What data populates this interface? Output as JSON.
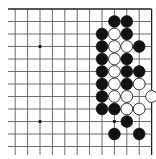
{
  "board": {
    "size": 19,
    "visible_cols": [
      6,
      18
    ],
    "visible_rows": [
      0,
      12
    ],
    "edges_shown": [
      "top",
      "right"
    ],
    "origin_px": {
      "col9_x": 40,
      "row0_y": 9
    },
    "spacing_px": {
      "x": 12.4,
      "y": 12.5
    },
    "colors": {
      "background": "#ffffff",
      "line": "#4a4a4a",
      "black_stone": "#111111",
      "white_stone": "#ffffff"
    }
  },
  "star_points": [
    {
      "col": 9,
      "row": 3
    },
    {
      "col": 9,
      "row": 9
    },
    {
      "col": 15,
      "row": 3
    },
    {
      "col": 15,
      "row": 9
    }
  ],
  "stones": [
    {
      "color": "black",
      "col": 15,
      "row": 1
    },
    {
      "color": "black",
      "col": 16,
      "row": 1
    },
    {
      "color": "black",
      "col": 14,
      "row": 2
    },
    {
      "color": "white",
      "col": 15,
      "row": 2
    },
    {
      "color": "black",
      "col": 16,
      "row": 2
    },
    {
      "color": "black",
      "col": 14,
      "row": 3
    },
    {
      "color": "white",
      "col": 15,
      "row": 3
    },
    {
      "color": "white",
      "col": 16,
      "row": 3
    },
    {
      "color": "black",
      "col": 17,
      "row": 3
    },
    {
      "color": "black",
      "col": 14,
      "row": 4
    },
    {
      "color": "white",
      "col": 15,
      "row": 4
    },
    {
      "color": "black",
      "col": 16,
      "row": 4
    },
    {
      "color": "black",
      "col": 14,
      "row": 5
    },
    {
      "color": "white",
      "col": 15,
      "row": 5
    },
    {
      "color": "black",
      "col": 16,
      "row": 5
    },
    {
      "color": "black",
      "col": 17,
      "row": 5
    },
    {
      "color": "black",
      "col": 14,
      "row": 6
    },
    {
      "color": "white",
      "col": 15,
      "row": 6
    },
    {
      "color": "black",
      "col": 16,
      "row": 6
    },
    {
      "color": "white",
      "col": 17,
      "row": 6
    },
    {
      "color": "black",
      "col": 14,
      "row": 7
    },
    {
      "color": "white",
      "col": 15,
      "row": 7
    },
    {
      "color": "white",
      "col": 16,
      "row": 7
    },
    {
      "color": "white",
      "col": 18,
      "row": 7
    },
    {
      "color": "black",
      "col": 14,
      "row": 8
    },
    {
      "color": "black",
      "col": 15,
      "row": 8
    },
    {
      "color": "white",
      "col": 16,
      "row": 8
    },
    {
      "color": "white",
      "col": 17,
      "row": 8
    },
    {
      "color": "black",
      "col": 16,
      "row": 9
    },
    {
      "color": "black",
      "col": 15,
      "row": 10
    },
    {
      "color": "black",
      "col": 17,
      "row": 10
    }
  ]
}
